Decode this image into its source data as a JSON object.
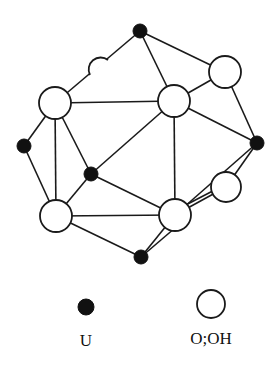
{
  "diagram": {
    "type": "structure",
    "colors": {
      "u_fill": "#111111",
      "o_fill": "#ffffff",
      "stroke": "#1a1a1a"
    }
  },
  "legend": {
    "items": [
      {
        "symbol": "filled-circle",
        "label": "U"
      },
      {
        "symbol": "open-circle",
        "label": "O;OH"
      }
    ]
  }
}
